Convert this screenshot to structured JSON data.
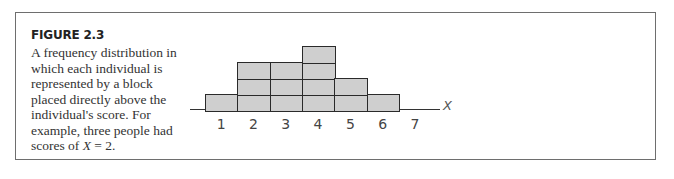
{
  "figure": {
    "title": "FIGURE 2.3",
    "caption_prefix": "A frequency distribution in which each individual is represented by a block placed directly above the individual's score. For example, three people had scores of ",
    "caption_var": "X",
    "caption_suffix": " = 2."
  },
  "chart_data": {
    "type": "bar",
    "title": "",
    "xlabel": "X",
    "ylabel": "",
    "categories": [
      "1",
      "2",
      "3",
      "4",
      "5",
      "6",
      "7"
    ],
    "values": [
      1,
      3,
      3,
      4,
      2,
      1,
      0
    ],
    "grid": false,
    "legend": null,
    "style": "stacked unit blocks (one block per individual)",
    "colors": {
      "block_fill": "#cfcfcf",
      "block_border": "#2a2a2a"
    }
  }
}
